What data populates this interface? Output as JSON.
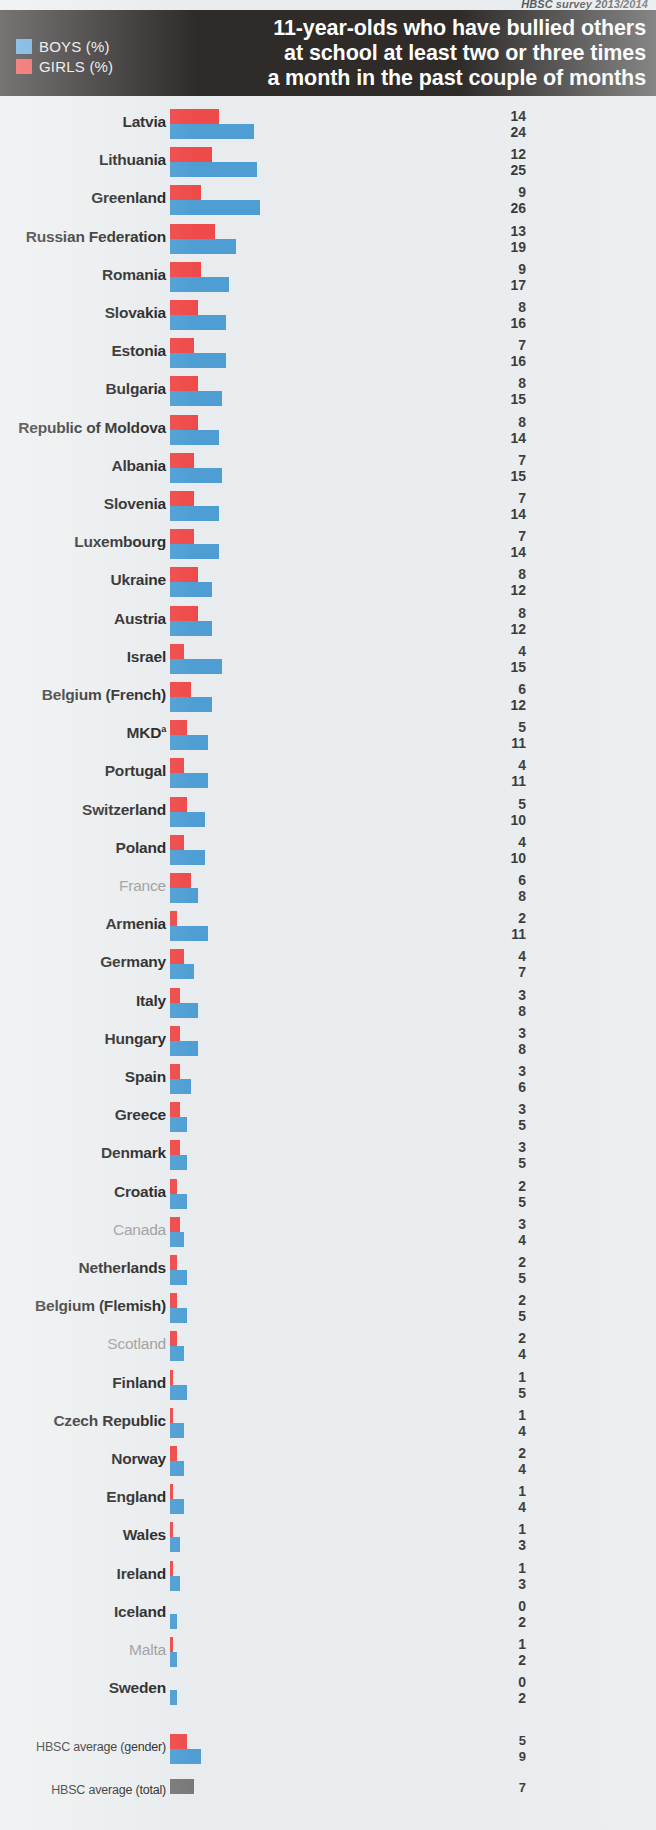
{
  "source_note": "HBSC survey 2013/2014",
  "header": {
    "title_lines": [
      "11-year-olds who have bullied others",
      "at school at least two or three times",
      "a month in the past couple of months"
    ],
    "legend": [
      {
        "label": "BOYS (%)",
        "color": "#5ba3d9",
        "key": "boys"
      },
      {
        "label": "GIRLS (%)",
        "color": "#ef4a4a",
        "key": "girls"
      }
    ]
  },
  "colors": {
    "boys": "#4e9ed4",
    "girls": "#ef4a4a",
    "total": "#787878",
    "header_bg": "#2e2b29",
    "page_bg": "#e9ecee",
    "label": "#1e1e1e",
    "label_muted": "#9a9a9a"
  },
  "chart_data": {
    "type": "bar",
    "title": "11-year-olds who have bullied others at school at least two or three times a month in the past couple of months",
    "subtitle": "HBSC survey 2013/2014",
    "xlabel": "",
    "ylabel": "",
    "orientation": "horizontal",
    "grid": false,
    "legend_position": "top-left",
    "value_unit": "%",
    "xlim": [
      0,
      26
    ],
    "categories": [
      "Latvia",
      "Lithuania",
      "Greenland",
      "Russian Federation",
      "Romania",
      "Slovakia",
      "Estonia",
      "Bulgaria",
      "Republic of Moldova",
      "Albania",
      "Slovenia",
      "Luxembourg",
      "Ukraine",
      "Austria",
      "Israel",
      "Belgium (French)",
      "MKD",
      "Portugal",
      "Switzerland",
      "Poland",
      "France",
      "Armenia",
      "Germany",
      "Italy",
      "Hungary",
      "Spain",
      "Greece",
      "Denmark",
      "Croatia",
      "Canada",
      "Netherlands",
      "Belgium (Flemish)",
      "Scotland",
      "Finland",
      "Czech Republic",
      "Norway",
      "England",
      "Wales",
      "Ireland",
      "Iceland",
      "Malta",
      "Sweden"
    ],
    "series": [
      {
        "name": "GIRLS (%)",
        "color": "#ef4a4a",
        "values": [
          14,
          12,
          9,
          13,
          9,
          8,
          7,
          8,
          8,
          7,
          7,
          7,
          8,
          8,
          4,
          6,
          5,
          4,
          5,
          4,
          6,
          2,
          4,
          3,
          3,
          3,
          3,
          3,
          2,
          3,
          2,
          2,
          2,
          1,
          1,
          2,
          1,
          1,
          1,
          0,
          1,
          0
        ]
      },
      {
        "name": "BOYS (%)",
        "color": "#4e9ed4",
        "values": [
          24,
          25,
          26,
          19,
          17,
          16,
          16,
          15,
          14,
          15,
          14,
          14,
          12,
          12,
          15,
          12,
          11,
          11,
          10,
          10,
          8,
          11,
          7,
          8,
          8,
          6,
          5,
          5,
          5,
          4,
          5,
          5,
          4,
          5,
          4,
          4,
          4,
          3,
          3,
          2,
          2,
          2
        ]
      }
    ],
    "averages": [
      {
        "label": "HBSC average (gender)",
        "girls": 5,
        "boys": 9
      },
      {
        "label": "HBSC average (total)",
        "total": 7
      }
    ]
  },
  "rows": [
    {
      "name": "Latvia",
      "girls": 14,
      "boys": 24,
      "muted": false
    },
    {
      "name": "Lithuania",
      "girls": 12,
      "boys": 25,
      "muted": false
    },
    {
      "name": "Greenland",
      "girls": 9,
      "boys": 26,
      "muted": false
    },
    {
      "name": "Russian Federation",
      "girls": 13,
      "boys": 19,
      "muted": false
    },
    {
      "name": "Romania",
      "girls": 9,
      "boys": 17,
      "muted": false
    },
    {
      "name": "Slovakia",
      "girls": 8,
      "boys": 16,
      "muted": false
    },
    {
      "name": "Estonia",
      "girls": 7,
      "boys": 16,
      "muted": false
    },
    {
      "name": "Bulgaria",
      "girls": 8,
      "boys": 15,
      "muted": false
    },
    {
      "name": "Republic of Moldova",
      "girls": 8,
      "boys": 14,
      "muted": false
    },
    {
      "name": "Albania",
      "girls": 7,
      "boys": 15,
      "muted": false
    },
    {
      "name": "Slovenia",
      "girls": 7,
      "boys": 14,
      "muted": false
    },
    {
      "name": "Luxembourg",
      "girls": 7,
      "boys": 14,
      "muted": false
    },
    {
      "name": "Ukraine",
      "girls": 8,
      "boys": 12,
      "muted": false
    },
    {
      "name": "Austria",
      "girls": 8,
      "boys": 12,
      "muted": false
    },
    {
      "name": "Israel",
      "girls": 4,
      "boys": 15,
      "muted": false
    },
    {
      "name": "Belgium (French)",
      "girls": 6,
      "boys": 12,
      "muted": false
    },
    {
      "name": "MKD",
      "sup": "a",
      "girls": 5,
      "boys": 11,
      "muted": false
    },
    {
      "name": "Portugal",
      "girls": 4,
      "boys": 11,
      "muted": false
    },
    {
      "name": "Switzerland",
      "girls": 5,
      "boys": 10,
      "muted": false
    },
    {
      "name": "Poland",
      "girls": 4,
      "boys": 10,
      "muted": false
    },
    {
      "name": "France",
      "girls": 6,
      "boys": 8,
      "muted": true
    },
    {
      "name": "Armenia",
      "girls": 2,
      "boys": 11,
      "muted": false
    },
    {
      "name": "Germany",
      "girls": 4,
      "boys": 7,
      "muted": false
    },
    {
      "name": "Italy",
      "girls": 3,
      "boys": 8,
      "muted": false
    },
    {
      "name": "Hungary",
      "girls": 3,
      "boys": 8,
      "muted": false
    },
    {
      "name": "Spain",
      "girls": 3,
      "boys": 6,
      "muted": false
    },
    {
      "name": "Greece",
      "girls": 3,
      "boys": 5,
      "muted": false
    },
    {
      "name": "Denmark",
      "girls": 3,
      "boys": 5,
      "muted": false
    },
    {
      "name": "Croatia",
      "girls": 2,
      "boys": 5,
      "muted": false
    },
    {
      "name": "Canada",
      "girls": 3,
      "boys": 4,
      "muted": true
    },
    {
      "name": "Netherlands",
      "girls": 2,
      "boys": 5,
      "muted": false
    },
    {
      "name": "Belgium (Flemish)",
      "girls": 2,
      "boys": 5,
      "muted": false
    },
    {
      "name": "Scotland",
      "girls": 2,
      "boys": 4,
      "muted": true
    },
    {
      "name": "Finland",
      "girls": 1,
      "boys": 5,
      "muted": false
    },
    {
      "name": "Czech Republic",
      "girls": 1,
      "boys": 4,
      "muted": false
    },
    {
      "name": "Norway",
      "girls": 2,
      "boys": 4,
      "muted": false
    },
    {
      "name": "England",
      "girls": 1,
      "boys": 4,
      "muted": false
    },
    {
      "name": "Wales",
      "girls": 1,
      "boys": 3,
      "muted": false
    },
    {
      "name": "Ireland",
      "girls": 1,
      "boys": 3,
      "muted": false
    },
    {
      "name": "Iceland",
      "girls": 0,
      "boys": 2,
      "muted": false
    },
    {
      "name": "Malta",
      "girls": 1,
      "boys": 2,
      "muted": true
    },
    {
      "name": "Sweden",
      "girls": 0,
      "boys": 2,
      "muted": false
    }
  ],
  "averages": {
    "gender": {
      "label": "HBSC average (gender)",
      "girls": 5,
      "boys": 9
    },
    "total": {
      "label": "HBSC average (total)",
      "value": 7
    }
  }
}
